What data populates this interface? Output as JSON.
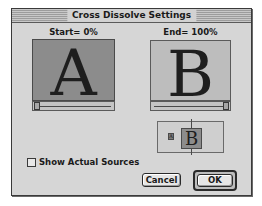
{
  "window": {
    "title": "Cross Dissolve Settings"
  },
  "start": {
    "label": "Start= 0%",
    "preview_letter": "A",
    "slider_value": 0
  },
  "end": {
    "label": "End= 100%",
    "preview_letter": "B",
    "slider_value": 100
  },
  "mini_preview": {
    "front_letter": "B",
    "back_letter": "A"
  },
  "options": {
    "show_actual_sources_label": "Show Actual Sources",
    "show_actual_sources_checked": false
  },
  "buttons": {
    "cancel_label": "Cancel",
    "ok_label": "OK"
  },
  "colors": {
    "window_bg": "#d6d6d6",
    "start_preview_bg": "#8c8c8c",
    "end_preview_bg": "#bdbdbd"
  }
}
